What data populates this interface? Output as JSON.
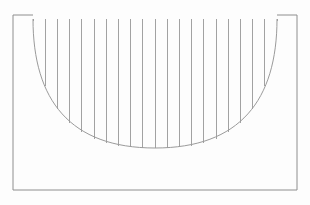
{
  "figure": {
    "kind": "line-drawing",
    "background_color": "#fefefe",
    "canvas": {
      "width": 310,
      "height": 205
    },
    "stroke_colors": {
      "frame": "#8e8e8e",
      "arc": "#9b9b9b",
      "chords": "#a2a2a2"
    },
    "frame": {
      "name": "outer-rectangle",
      "left": 13,
      "top": 15,
      "right": 297,
      "bottom": 190,
      "width": 284,
      "height": 175,
      "stroke_width": 1
    },
    "top_segments": [
      {
        "name": "top-left-segment",
        "x1": 13,
        "y1": 15,
        "x2": 33,
        "y2": 15
      },
      {
        "name": "top-right-segment",
        "x1": 277,
        "y1": 15,
        "x2": 297,
        "y2": 15
      }
    ],
    "arc": {
      "name": "semicircular-arc",
      "start_x": 33,
      "start_y": 19,
      "end_x": 277,
      "end_y": 19,
      "bottom_x": 155,
      "bottom_y": 148,
      "span_width": 244,
      "depth": 129,
      "path": "M 33 19 C 33 100, 70 148, 155 148 C 240 148, 277 100, 277 19"
    },
    "chords": {
      "name": "vertical-chord-lines",
      "count": 21,
      "top_y": 19,
      "first_x": 33,
      "last_x": 277,
      "spacing": 12.2,
      "x_positions": [
        33,
        45.2,
        57.4,
        69.6,
        81.8,
        94,
        106.2,
        118.4,
        130.6,
        142.8,
        155,
        167.2,
        179.4,
        191.6,
        203.8,
        216,
        228.2,
        240.4,
        252.6,
        264.8,
        277
      ],
      "bottom_y_values": [
        21,
        86,
        109,
        123,
        132,
        139,
        143,
        146,
        147,
        148,
        148,
        148,
        147,
        146,
        143,
        139,
        132,
        123,
        109,
        86,
        21
      ]
    }
  }
}
